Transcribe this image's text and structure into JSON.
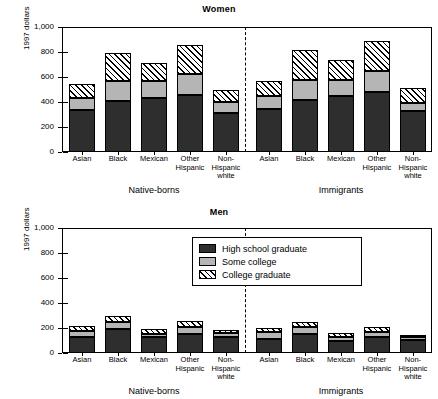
{
  "chart_data": [
    {
      "type": "bar",
      "title": "Women",
      "xlabel": "",
      "ylabel": "1997 dollars",
      "ylim": [
        0,
        1000
      ],
      "yticks": [
        0,
        200,
        400,
        600,
        800,
        1000
      ],
      "ytick_labels": [
        "0",
        "200",
        "400",
        "600",
        "800",
        "1,000"
      ],
      "grid": false,
      "stacked": true,
      "legend": [
        "High school graduate",
        "Some college",
        "College graduate"
      ],
      "groups": [
        "Native-borns",
        "Immigrants"
      ],
      "categories": [
        "Asian",
        "Black",
        "Mexican",
        "Other\nHispanic",
        "Non-\nHispanic\nwhite",
        "Asian",
        "Black",
        "Mexican",
        "Other\nHispanic",
        "Non-\nHispanic\nwhite"
      ],
      "series": [
        {
          "name": "High school graduate",
          "values": [
            335,
            410,
            435,
            455,
            315,
            345,
            420,
            445,
            480,
            330
          ]
        },
        {
          "name": "Some college",
          "values": [
            95,
            155,
            135,
            170,
            85,
            105,
            160,
            135,
            170,
            65
          ]
        },
        {
          "name": "College graduate",
          "values": [
            115,
            225,
            145,
            230,
            100,
            115,
            235,
            160,
            240,
            120
          ]
        }
      ],
      "cumulative_tops": [
        [
          335,
          430,
          545
        ],
        [
          410,
          565,
          790
        ],
        [
          435,
          570,
          715
        ],
        [
          455,
          625,
          855
        ],
        [
          315,
          400,
          500
        ],
        [
          345,
          450,
          565
        ],
        [
          420,
          580,
          815
        ],
        [
          445,
          580,
          740
        ],
        [
          480,
          650,
          890
        ],
        [
          330,
          395,
          515
        ]
      ]
    },
    {
      "type": "bar",
      "title": "Men",
      "xlabel": "",
      "ylabel": "1997 dollars",
      "ylim": [
        0,
        1000
      ],
      "yticks": [
        0,
        200,
        400,
        600,
        800,
        1000
      ],
      "ytick_labels": [
        "0",
        "200",
        "400",
        "600",
        "800",
        "1,000"
      ],
      "grid": false,
      "stacked": true,
      "legend": [
        "High school graduate",
        "Some college",
        "College graduate"
      ],
      "groups": [
        "Native-borns",
        "Immigrants"
      ],
      "categories": [
        "Asian",
        "Black",
        "Mexican",
        "Other\nHispanic",
        "Non-\nHispanic\nwhite",
        "Asian",
        "Black",
        "Mexican",
        "Other\nHispanic",
        "Non-\nHispanic\nwhite"
      ],
      "series": [
        {
          "name": "High school graduate",
          "values": [
            125,
            190,
            125,
            155,
            130,
            115,
            150,
            100,
            130,
            105
          ]
        },
        {
          "name": "Some college",
          "values": [
            50,
            55,
            30,
            50,
            30,
            55,
            55,
            30,
            35,
            20
          ]
        },
        {
          "name": "College graduate",
          "values": [
            40,
            50,
            35,
            55,
            25,
            30,
            45,
            30,
            45,
            20
          ]
        }
      ],
      "cumulative_tops": [
        [
          125,
          175,
          215
        ],
        [
          190,
          245,
          295
        ],
        [
          125,
          155,
          190
        ],
        [
          155,
          205,
          260
        ],
        [
          130,
          160,
          185
        ],
        [
          115,
          170,
          200
        ],
        [
          150,
          205,
          250
        ],
        [
          100,
          130,
          160
        ],
        [
          130,
          165,
          210
        ],
        [
          105,
          125,
          145
        ]
      ]
    }
  ],
  "legend": {
    "items": [
      {
        "label": "High school graduate",
        "swatch": "solid-dark",
        "color": "#2e2e2e"
      },
      {
        "label": "Some college",
        "swatch": "solid-gray",
        "color": "#b5b5b5"
      },
      {
        "label": "College graduate",
        "swatch": "hatched",
        "color": "#ffffff"
      }
    ]
  }
}
